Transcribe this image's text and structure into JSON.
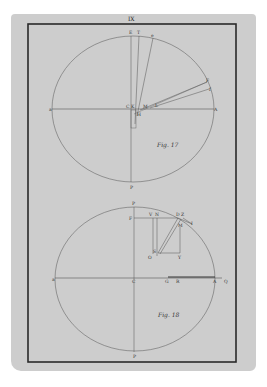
{
  "plate": {
    "number": "IX",
    "paper_color": "#cdcdcd",
    "ink_color": "#2a2a2a",
    "line_color": "#555555"
  },
  "figures": [
    {
      "caption": "Fig. 17",
      "labels": {
        "top_e": "E",
        "top_t": "T",
        "top_e2": "e",
        "left": "a",
        "right": "A",
        "center_c": "C",
        "center_k": "K",
        "m": "M",
        "l": "L",
        "h": "H",
        "f": "F",
        "f2": "f",
        "bottom": "P"
      }
    },
    {
      "caption": "Fig. 18",
      "labels": {
        "top": "P",
        "f": "F",
        "v": "V",
        "n": "N",
        "d": "D",
        "z": "Z",
        "i": "I",
        "m": "M",
        "o": "O",
        "s": "S",
        "y": "Y",
        "left": "a",
        "center": "C",
        "g": "G",
        "r": "R",
        "right": "A",
        "q": "Q",
        "bottom": "P"
      }
    }
  ]
}
